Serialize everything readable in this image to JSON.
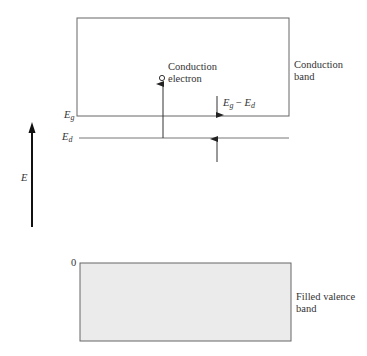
{
  "diagram": {
    "conduction_band": {
      "label_line1": "Conduction",
      "label_line2": "band",
      "edge_symbol": "E",
      "edge_subscript": "g"
    },
    "donor_level": {
      "symbol": "E",
      "subscript": "d"
    },
    "conduction_electron": {
      "label_line1": "Conduction",
      "label_line2": "electron"
    },
    "gap_annotation": {
      "e1": "E",
      "s1": "g",
      "minus": " − ",
      "e2": "E",
      "s2": "d"
    },
    "energy_axis": {
      "label": "E"
    },
    "valence_band": {
      "zero_label": "0",
      "label_line1": "Filled valence",
      "label_line2": "band",
      "fill_color": "#ebebeb"
    },
    "colors": {
      "line": "#555555",
      "axis": "#111111"
    }
  }
}
